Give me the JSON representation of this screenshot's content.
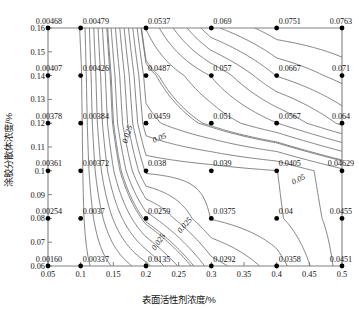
{
  "chart_data": {
    "type": "contour",
    "title": "",
    "xlabel": "表面活性剂浓度/%",
    "ylabel": "涂胶分散体浓度/%",
    "xlim": [
      0.05,
      0.5
    ],
    "ylim": [
      0.06,
      0.16
    ],
    "xticks": [
      "0.05",
      "0.1",
      "0.15",
      "0.2",
      "0.25",
      "0.3",
      "0.35",
      "0.4",
      "0.45",
      "0.5"
    ],
    "xtick_values": [
      0.05,
      0.1,
      0.15,
      0.2,
      0.25,
      0.3,
      0.35,
      0.4,
      0.45,
      0.5
    ],
    "yticks": [
      "0.06",
      "0.07",
      "0.08",
      "0.09",
      "0.1",
      "0.11",
      "0.12",
      "0.13",
      "0.14",
      "0.15",
      "0.16"
    ],
    "ytick_values": [
      0.06,
      0.07,
      0.08,
      0.09,
      0.1,
      0.11,
      0.12,
      0.13,
      0.14,
      0.15,
      0.16
    ],
    "grid": false,
    "legend": "none",
    "contour_levels": [
      "0.025",
      "0.05"
    ],
    "contour_inline_labels": [
      {
        "text": "0.025",
        "x": 0.175,
        "y": 0.115,
        "rotation": -72
      },
      {
        "text": "0.025",
        "x": 0.262,
        "y": 0.0765,
        "rotation": -50
      },
      {
        "text": "0.025",
        "x": 0.222,
        "y": 0.0695,
        "rotation": -55
      },
      {
        "text": "0.05",
        "x": 0.222,
        "y": 0.1128,
        "rotation": -22
      },
      {
        "text": "0.05",
        "x": 0.435,
        "y": 0.0955,
        "rotation": -27
      }
    ],
    "point_x": [
      0.05,
      0.1,
      0.2,
      0.3,
      0.4,
      0.5
    ],
    "point_y": [
      0.06,
      0.08,
      0.1,
      0.12,
      0.14,
      0.16
    ],
    "points": [
      {
        "x": 0.05,
        "y": 0.16,
        "label": "0.00468"
      },
      {
        "x": 0.1,
        "y": 0.16,
        "label": "0.00479"
      },
      {
        "x": 0.2,
        "y": 0.16,
        "label": "0.0537"
      },
      {
        "x": 0.3,
        "y": 0.16,
        "label": "0.069"
      },
      {
        "x": 0.4,
        "y": 0.16,
        "label": "0.0751"
      },
      {
        "x": 0.5,
        "y": 0.16,
        "label": "0.0763"
      },
      {
        "x": 0.05,
        "y": 0.14,
        "label": "0.00407"
      },
      {
        "x": 0.1,
        "y": 0.14,
        "label": "0.00426"
      },
      {
        "x": 0.2,
        "y": 0.14,
        "label": "0.0487"
      },
      {
        "x": 0.3,
        "y": 0.14,
        "label": "0.057"
      },
      {
        "x": 0.4,
        "y": 0.14,
        "label": "0.0667"
      },
      {
        "x": 0.5,
        "y": 0.14,
        "label": "0.071"
      },
      {
        "x": 0.05,
        "y": 0.12,
        "label": "0.00378"
      },
      {
        "x": 0.1,
        "y": 0.12,
        "label": "0.00384"
      },
      {
        "x": 0.2,
        "y": 0.12,
        "label": "0.0459"
      },
      {
        "x": 0.3,
        "y": 0.12,
        "label": "0.051"
      },
      {
        "x": 0.4,
        "y": 0.12,
        "label": "0.0567"
      },
      {
        "x": 0.5,
        "y": 0.12,
        "label": "0.064"
      },
      {
        "x": 0.05,
        "y": 0.1,
        "label": "0.00361"
      },
      {
        "x": 0.1,
        "y": 0.1,
        "label": "0.00372"
      },
      {
        "x": 0.2,
        "y": 0.1,
        "label": "0.038"
      },
      {
        "x": 0.3,
        "y": 0.1,
        "label": "0.039"
      },
      {
        "x": 0.4,
        "y": 0.1,
        "label": "0.0405"
      },
      {
        "x": 0.5,
        "y": 0.1,
        "label": "0.04629"
      },
      {
        "x": 0.05,
        "y": 0.08,
        "label": "0.00254"
      },
      {
        "x": 0.1,
        "y": 0.08,
        "label": "0.0037"
      },
      {
        "x": 0.2,
        "y": 0.08,
        "label": "0.0259"
      },
      {
        "x": 0.3,
        "y": 0.08,
        "label": "0.0375"
      },
      {
        "x": 0.4,
        "y": 0.08,
        "label": "0.04"
      },
      {
        "x": 0.5,
        "y": 0.08,
        "label": "0.0455"
      },
      {
        "x": 0.05,
        "y": 0.06,
        "label": "0.00160"
      },
      {
        "x": 0.1,
        "y": 0.06,
        "label": "0.00337"
      },
      {
        "x": 0.2,
        "y": 0.06,
        "label": "0.0135"
      },
      {
        "x": 0.3,
        "y": 0.06,
        "label": "0.0292"
      },
      {
        "x": 0.4,
        "y": 0.06,
        "label": "0.0358"
      },
      {
        "x": 0.5,
        "y": 0.06,
        "label": "0.0451"
      }
    ],
    "colors": {
      "contour": "#6d6d6d",
      "axis": "#808080",
      "point": "#000000",
      "text": "#111111",
      "background": "#ffffff"
    }
  }
}
